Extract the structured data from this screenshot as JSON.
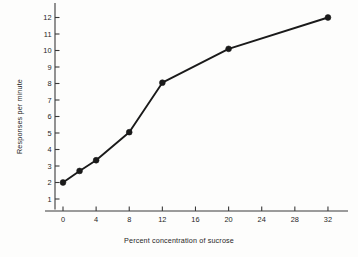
{
  "chart_data": {
    "type": "line",
    "title": "",
    "xlabel": "Percent concentration of sucrose",
    "ylabel": "Responses per minute",
    "x": [
      0,
      2,
      4,
      8,
      12,
      20,
      32
    ],
    "values": [
      2.0,
      2.7,
      3.35,
      5.05,
      8.05,
      10.1,
      12.0
    ],
    "series": [
      {
        "name": "Responses per minute",
        "x": [
          0,
          2,
          4,
          8,
          12,
          20,
          32
        ],
        "values": [
          2.0,
          2.7,
          3.35,
          5.05,
          8.05,
          10.1,
          12.0
        ]
      }
    ],
    "xlim": [
      -2,
      34.5
    ],
    "ylim": [
      0.2,
      12.6
    ],
    "xticks": [
      0,
      4,
      8,
      12,
      16,
      20,
      24,
      28,
      32
    ],
    "xticklabels": [
      "0",
      "4",
      "8",
      "12",
      "16",
      "20",
      "24",
      "28",
      "32"
    ],
    "yticks": [
      1,
      2,
      3,
      4,
      5,
      6,
      7,
      8,
      9,
      10,
      11,
      12
    ],
    "yticklabels": [
      "1",
      "2",
      "3",
      "4",
      "5",
      "6",
      "7",
      "8",
      "9",
      "10",
      "11",
      "12"
    ],
    "grid": false,
    "legend": "none",
    "marker": "filled-circle",
    "line_color": "#1a1a1a",
    "marker_color": "#1a1a1a",
    "axis_color": "#3a3a3a",
    "background_color": "#fdfdfc"
  }
}
